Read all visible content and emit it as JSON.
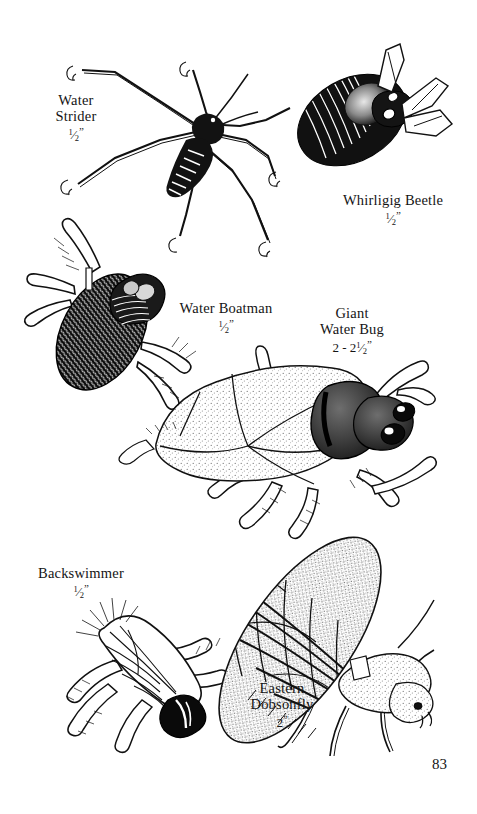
{
  "page": {
    "background_color": "#ffffff",
    "ink_color": "#111111",
    "page_number": "83",
    "width": 477,
    "height": 814
  },
  "figures": [
    {
      "id": "water-strider",
      "name_lines": [
        "Water",
        "Strider"
      ],
      "size_numerator": "1",
      "size_denominator": "2",
      "size_whole": "",
      "size_unit": "”",
      "size_text": "1/2”",
      "illustration": "water-strider-drawing"
    },
    {
      "id": "whirligig-beetle",
      "name_lines": [
        "Whirligig Beetle"
      ],
      "size_numerator": "1",
      "size_denominator": "2",
      "size_whole": "",
      "size_unit": "”",
      "size_text": "1/2”",
      "illustration": "whirligig-beetle-drawing"
    },
    {
      "id": "water-boatman",
      "name_lines": [
        "Water Boatman"
      ],
      "size_numerator": "1",
      "size_denominator": "2",
      "size_whole": "",
      "size_unit": "”",
      "size_text": "1/2”",
      "illustration": "water-boatman-drawing"
    },
    {
      "id": "giant-water-bug",
      "name_lines": [
        "Giant",
        "Water Bug"
      ],
      "size_numerator": "1",
      "size_denominator": "2",
      "size_whole": "2 - 2",
      "size_unit": "”",
      "size_text": "2 - 2 1/2”",
      "illustration": "giant-water-bug-drawing"
    },
    {
      "id": "backswimmer",
      "name_lines": [
        "Backswimmer"
      ],
      "size_numerator": "1",
      "size_denominator": "2",
      "size_whole": "",
      "size_unit": "”",
      "size_text": "1/2”",
      "illustration": "backswimmer-drawing"
    },
    {
      "id": "eastern-dobsonfly",
      "name_lines": [
        "Eastern",
        "Dobsonfly"
      ],
      "size_numerator": "",
      "size_denominator": "",
      "size_whole": "2",
      "size_unit": "”",
      "size_text": "2”",
      "illustration": "eastern-dobsonfly-drawing"
    }
  ],
  "labels": {
    "water_strider": {
      "line1": "Water",
      "line2": "Strider"
    },
    "whirligig_beetle": {
      "line1": "Whirligig Beetle"
    },
    "water_boatman": {
      "line1": "Water Boatman"
    },
    "giant_water_bug": {
      "line1": "Giant",
      "line2": "Water Bug",
      "size_whole": "2 - 2"
    },
    "backswimmer": {
      "line1": "Backswimmer"
    },
    "eastern_dobsonfly": {
      "line1": "Eastern",
      "line2": "Dobsonfly",
      "size_whole": "2"
    },
    "half_numerator": "1",
    "half_denominator": "2",
    "inch_mark": "”"
  }
}
